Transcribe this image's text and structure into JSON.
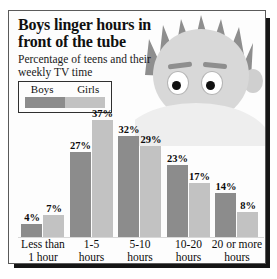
{
  "headline": "Boys linger hours in front of the tube",
  "subtitle": "Percentage of teens and their weekly TV time",
  "legend": {
    "boys_label": "Boys",
    "girls_label": "Girls",
    "boys_color": "#8c8c8c",
    "girls_color": "#c2c2c2"
  },
  "source": "Source: Gallup Poll online survey of 1,200 respondents age 13-17.",
  "artwork": {
    "name": "cartoon-boy-head",
    "hair_color": "#8e8e8e",
    "face_color": "#d8d8d8"
  },
  "chart_data": {
    "type": "bar",
    "title": "Boys linger hours in front of the tube",
    "subtitle": "Percentage of teens and their weekly TV time",
    "categories": [
      "Less than 1 hour",
      "1-5 hours",
      "5-10 hours",
      "10-20 hours",
      "20 or more hours"
    ],
    "category_lines": [
      [
        "Less than",
        "1 hour"
      ],
      [
        "1-5",
        "hours"
      ],
      [
        "5-10",
        "hours"
      ],
      [
        "10-20",
        "hours"
      ],
      [
        "20 or more",
        "hours"
      ]
    ],
    "series": [
      {
        "name": "Boys",
        "color": "#8c8c8c",
        "values": [
          4,
          27,
          32,
          23,
          14
        ],
        "labels": [
          "4%",
          "27%",
          "32%",
          "23%",
          "14%"
        ]
      },
      {
        "name": "Girls",
        "color": "#c2c2c2",
        "values": [
          7,
          37,
          29,
          17,
          8
        ],
        "labels": [
          "7%",
          "37%",
          "29%",
          "17%",
          "8%"
        ]
      }
    ],
    "xlabel": "",
    "ylabel": "Percentage",
    "ylim": [
      0,
      40
    ],
    "grid": false,
    "legend_position": "top-left",
    "value_labels_shown": true
  }
}
